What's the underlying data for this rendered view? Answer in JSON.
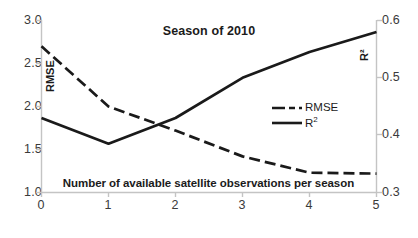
{
  "chart_data": {
    "type": "line",
    "title": "Season of 2010",
    "xlabel": "Number of available satellite observations per season",
    "ylabel": "RMSE",
    "y2label": "R²",
    "x": [
      0,
      1,
      2,
      3,
      4,
      5
    ],
    "categories": [
      "0",
      "1",
      "2",
      "3",
      "4",
      "5"
    ],
    "xlim": [
      0,
      5
    ],
    "ylim": [
      1.0,
      3.0
    ],
    "y2lim": [
      0.3,
      0.6
    ],
    "xticks": [
      "0",
      "1",
      "2",
      "3",
      "4",
      "5"
    ],
    "yticks": [
      "1.0",
      "1.5",
      "2.0",
      "2.5",
      "3.0"
    ],
    "y2ticks": [
      "0.3",
      "0.4",
      "0.5",
      "0.6"
    ],
    "grid": false,
    "legend_position": "center-right",
    "series": [
      {
        "name": "RMSE",
        "axis": "left",
        "style": "dashed",
        "color": "#1a1a1a",
        "values": [
          2.7,
          2.0,
          1.72,
          1.42,
          1.23,
          1.22
        ]
      },
      {
        "name": "R²",
        "axis": "right",
        "style": "solid",
        "color": "#1a1a1a",
        "values": [
          0.43,
          0.385,
          0.43,
          0.5,
          0.545,
          0.58
        ]
      }
    ],
    "legend": [
      {
        "label": "RMSE",
        "style": "dashed"
      },
      {
        "label": "R²",
        "style": "solid"
      }
    ],
    "axis_color": "#bfbfbf",
    "text_color": "#3a3a3a"
  },
  "labels": {
    "legend_rmse": "RMSE",
    "legend_r2": "R",
    "legend_r2_sup": "2",
    "rmse_axis_title": "RMSE",
    "r2_axis_title": "R²"
  }
}
